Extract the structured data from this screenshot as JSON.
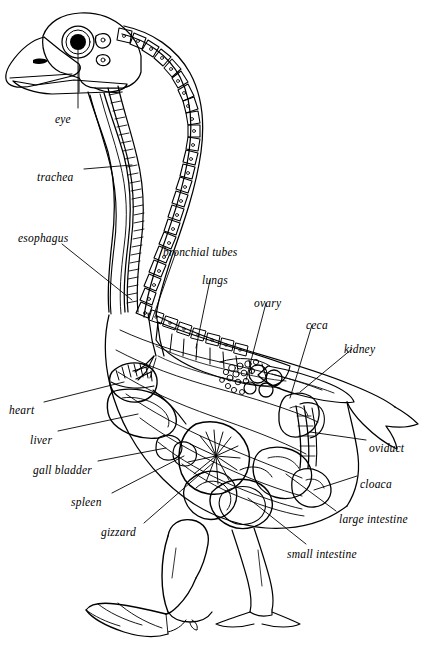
{
  "figure": {
    "title": "",
    "background_color": "#ffffff",
    "ink_color": "#000000",
    "width": 421,
    "height": 648
  },
  "labels": [
    {
      "id": "eye",
      "text": "eye",
      "x": 55,
      "y": 114,
      "anchor": "start"
    },
    {
      "id": "trachea",
      "text": "trachea",
      "x": 37,
      "y": 172,
      "anchor": "start"
    },
    {
      "id": "esophagus",
      "text": "esophagus",
      "x": 18,
      "y": 233,
      "anchor": "start"
    },
    {
      "id": "bronchial-tubes",
      "text": "bronchial tubes",
      "x": 163,
      "y": 247,
      "anchor": "start"
    },
    {
      "id": "lungs",
      "text": "lungs",
      "x": 202,
      "y": 275,
      "anchor": "start"
    },
    {
      "id": "ovary",
      "text": "ovary",
      "x": 254,
      "y": 298,
      "anchor": "start"
    },
    {
      "id": "ceca",
      "text": "ceca",
      "x": 306,
      "y": 320,
      "anchor": "start"
    },
    {
      "id": "kidney",
      "text": "kidney",
      "x": 344,
      "y": 344,
      "anchor": "start"
    },
    {
      "id": "heart",
      "text": "heart",
      "x": 9,
      "y": 405,
      "anchor": "start"
    },
    {
      "id": "liver",
      "text": "liver",
      "x": 30,
      "y": 435,
      "anchor": "start"
    },
    {
      "id": "gall-bladder",
      "text": "gall bladder",
      "x": 33,
      "y": 465,
      "anchor": "start"
    },
    {
      "id": "spleen",
      "text": "spleen",
      "x": 71,
      "y": 497,
      "anchor": "start"
    },
    {
      "id": "gizzard",
      "text": "gizzard",
      "x": 101,
      "y": 527,
      "anchor": "start"
    },
    {
      "id": "oviduct",
      "text": "oviduct",
      "x": 369,
      "y": 443,
      "anchor": "start"
    },
    {
      "id": "cloaca",
      "text": "cloaca",
      "x": 360,
      "y": 479,
      "anchor": "start"
    },
    {
      "id": "large-intestine",
      "text": "large intestine",
      "x": 339,
      "y": 514,
      "anchor": "start"
    },
    {
      "id": "small-intestine",
      "text": "small intestine",
      "x": 287,
      "y": 549,
      "anchor": "start"
    }
  ]
}
